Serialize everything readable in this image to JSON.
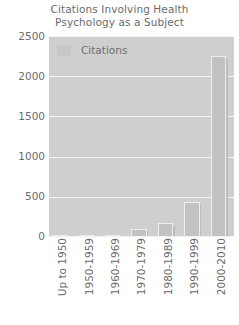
{
  "chart_data": {
    "type": "bar",
    "title": "Citations Involving Health Psychology as a Subject",
    "title_lines": [
      "Citations Involving Health",
      "Psychology as a Subject"
    ],
    "xlabel": "",
    "ylabel": "",
    "categories": [
      "Up to 1950",
      "1950-1959",
      "1960-1969",
      "1970-1979",
      "1980-1989",
      "1990-1999",
      "2000-2010"
    ],
    "values": [
      15,
      20,
      25,
      105,
      170,
      430,
      2250
    ],
    "series": [
      {
        "name": "Citations",
        "values": [
          15,
          20,
          25,
          105,
          170,
          430,
          2250
        ]
      }
    ],
    "ylim": [
      0,
      2500
    ],
    "ytick_labels": [
      "0",
      "500",
      "1000",
      "1500",
      "2000",
      "2500"
    ],
    "ytick_values": [
      0,
      500,
      1000,
      1500,
      2000,
      2500
    ],
    "grid": true,
    "legend": {
      "position": "top-left-inside",
      "entries": [
        "Citations"
      ]
    },
    "colors": {
      "plot_background": "#cfcfcf",
      "bar_fill": "#c2c2c2",
      "bar_edge": "#ededed",
      "gridline": "#f3f3f3",
      "text": "#6b6b6b",
      "page_background": "#ffffff"
    }
  }
}
